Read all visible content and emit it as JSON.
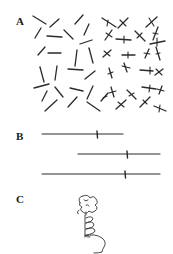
{
  "figure": {
    "panels": [
      {
        "label": "A",
        "x": 16,
        "y": 16,
        "description": "field of oriented line segments; right half contains crossed segments"
      },
      {
        "label": "B",
        "x": 16,
        "y": 130,
        "description": "three horizontal lines each with a small vertical tick mark"
      },
      {
        "label": "C",
        "x": 16,
        "y": 190,
        "description": "freehand drawing of a coiled figure"
      }
    ],
    "colors": {
      "ink": "#2a2a2a",
      "background": "#ffffff"
    },
    "panel_a": {
      "plain_segments": [
        [
          33,
          16,
          46,
          24
        ],
        [
          35,
          38,
          41,
          28
        ],
        [
          47,
          36,
          62,
          37
        ],
        [
          50,
          27,
          59,
          19
        ],
        [
          64,
          30,
          73,
          39
        ],
        [
          75,
          24,
          83,
          15
        ],
        [
          80,
          44,
          92,
          40
        ],
        [
          84,
          35,
          89,
          24
        ],
        [
          38,
          55,
          45,
          47
        ],
        [
          48,
          53,
          61,
          53
        ],
        [
          75,
          66,
          77,
          50
        ],
        [
          89,
          48,
          93,
          63
        ],
        [
          40,
          67,
          44,
          82
        ],
        [
          55,
          80,
          57,
          66
        ],
        [
          68,
          69,
          83,
          70
        ],
        [
          85,
          79,
          95,
          71
        ],
        [
          34,
          88,
          49,
          84
        ],
        [
          55,
          87,
          63,
          97
        ],
        [
          70,
          88,
          83,
          91
        ],
        [
          87,
          99,
          93,
          86
        ],
        [
          42,
          101,
          47,
          91
        ],
        [
          45,
          111,
          57,
          100
        ],
        [
          68,
          107,
          77,
          97
        ],
        [
          87,
          102,
          100,
          111
        ]
      ],
      "crossed_segments": [
        [
          102,
          18,
          116,
          27,
          108,
          20,
          107,
          26
        ],
        [
          118,
          28,
          128,
          18,
          120,
          20,
          126,
          26
        ],
        [
          105,
          40,
          112,
          30,
          106,
          33,
          112,
          37
        ],
        [
          116,
          39,
          131,
          40,
          124,
          36,
          124,
          43
        ],
        [
          135,
          31,
          145,
          41,
          137,
          38,
          142,
          33
        ],
        [
          146,
          27,
          157,
          17,
          149,
          18,
          154,
          26
        ],
        [
          153,
          40,
          158,
          27,
          153,
          33,
          158,
          34
        ],
        [
          150,
          44,
          165,
          41,
          157,
          38,
          157,
          46
        ],
        [
          103,
          57,
          111,
          50,
          104,
          51,
          110,
          56
        ],
        [
          122,
          55,
          135,
          55,
          128,
          52,
          128,
          58
        ],
        [
          145,
          58,
          149,
          49,
          144,
          53,
          150,
          54
        ],
        [
          156,
          47,
          160,
          60,
          156,
          54,
          160,
          53
        ],
        [
          109,
          68,
          112,
          78,
          108,
          74,
          113,
          72
        ],
        [
          124,
          63,
          127,
          72,
          122,
          66,
          130,
          68
        ],
        [
          140,
          70,
          153,
          71,
          150,
          67,
          150,
          74
        ],
        [
          155,
          75,
          163,
          69,
          156,
          69,
          162,
          75
        ],
        [
          111,
          87,
          114,
          97,
          109,
          93,
          116,
          91
        ],
        [
          127,
          90,
          136,
          99,
          129,
          96,
          134,
          93
        ],
        [
          142,
          87,
          156,
          89,
          150,
          85,
          149,
          92
        ],
        [
          159,
          94,
          162,
          86,
          157,
          89,
          164,
          91
        ],
        [
          116,
          109,
          126,
          100,
          118,
          102,
          124,
          107
        ],
        [
          140,
          107,
          150,
          97,
          143,
          100,
          147,
          104
        ],
        [
          154,
          106,
          166,
          111,
          160,
          105,
          159,
          112
        ],
        [
          101,
          101,
          108,
          93,
          103,
          98,
          107,
          96
        ]
      ]
    },
    "panel_b": {
      "lines": [
        {
          "x1": 42,
          "x2": 123,
          "y": 134,
          "tick_x": 97
        },
        {
          "x1": 78,
          "x2": 160,
          "y": 154,
          "tick_x": 127
        },
        {
          "x1": 42,
          "x2": 160,
          "y": 174,
          "tick_x": 125
        }
      ]
    }
  }
}
